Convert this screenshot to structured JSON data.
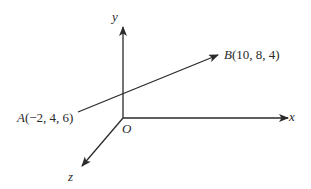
{
  "diagram": {
    "type": "3d-coordinate-axes",
    "axes": {
      "x_label": "x",
      "y_label": "y",
      "z_label": "z",
      "origin_label": "O"
    },
    "points": [
      {
        "name": "A",
        "coords": "(−2, 4, 6)",
        "x": -2,
        "y": 4,
        "z": 6
      },
      {
        "name": "B",
        "coords": "(10, 8, 4)",
        "x": 10,
        "y": 8,
        "z": 4
      }
    ],
    "vector": {
      "from": "A",
      "to": "B"
    },
    "colors": {
      "line": "#2a2a2a",
      "background": "#ffffff"
    }
  }
}
